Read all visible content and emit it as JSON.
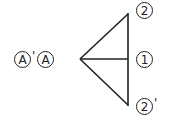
{
  "diagram": {
    "left_labels": [
      {
        "text": "A",
        "circled": true,
        "prime": true,
        "prime_text": "'"
      },
      {
        "text": "A",
        "circled": true,
        "prime": false
      }
    ],
    "right_labels": {
      "top": {
        "text": "2",
        "circled": true,
        "prime": false
      },
      "middle": {
        "text": "1",
        "circled": true,
        "prime": false
      },
      "bottom": {
        "text": "2",
        "circled": true,
        "prime": true,
        "prime_text": "'"
      }
    },
    "stroke_color": "#222222",
    "background": "#ffffff"
  }
}
